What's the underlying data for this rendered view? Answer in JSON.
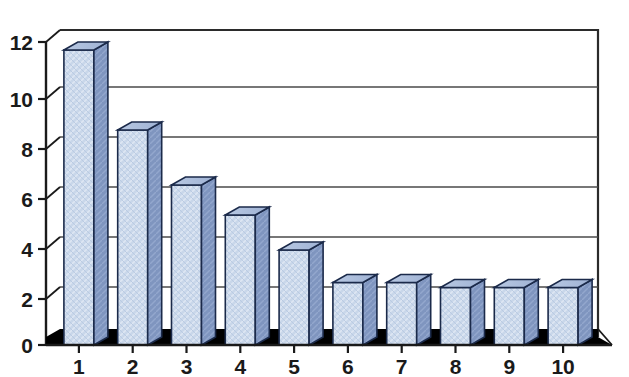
{
  "chart_data": {
    "type": "bar",
    "title": "",
    "subtitle": "",
    "xlabel": "",
    "ylabel": "",
    "categories": [
      "1",
      "2",
      "3",
      "4",
      "5",
      "6",
      "7",
      "8",
      "9",
      "10"
    ],
    "values": [
      11.8,
      8.6,
      6.4,
      5.2,
      3.8,
      2.5,
      2.5,
      2.3,
      2.3,
      2.3
    ],
    "ylim": [
      0,
      12
    ],
    "xlim_categories": 10,
    "y_ticks": [
      0,
      2,
      4,
      6,
      8,
      10,
      12
    ],
    "y_tick_labels": [
      "0",
      "2",
      "4",
      "6",
      "8",
      "10",
      "12"
    ],
    "x_tick_labels": [
      "1",
      "2",
      "3",
      "4",
      "5",
      "6",
      "7",
      "8",
      "9",
      "10"
    ],
    "grid": true,
    "grid_axis": "y",
    "legend": false,
    "legend_position": "none",
    "style": "3d-column",
    "annotations": [],
    "colors": {
      "bar_front": "#c9d7ea",
      "bar_side": "#7f95bf",
      "bar_top": "#aebfdc",
      "bar_outline": "#1b2a4a",
      "gridline": "#4a4a4a",
      "axis": "#1a1a1a",
      "frame": "#2b2b2b",
      "floor": "#000000",
      "background": "#ffffff",
      "text": "#1a1a1a"
    }
  },
  "labels": {
    "y": {
      "t0": "0",
      "t1": "2",
      "t2": "4",
      "t3": "6",
      "t4": "8",
      "t5": "10",
      "t6": "12"
    },
    "x": {
      "c0": "1",
      "c1": "2",
      "c2": "3",
      "c3": "4",
      "c4": "5",
      "c5": "6",
      "c6": "7",
      "c7": "8",
      "c8": "9",
      "c9": "10"
    }
  }
}
